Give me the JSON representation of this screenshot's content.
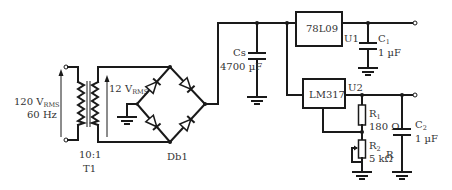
{
  "diagram": {
    "type": "power-supply-schematic",
    "source": {
      "voltage_main": "120 V",
      "voltage_sub": "RMS",
      "frequency": "60 Hz"
    },
    "transformer": {
      "ratio": "10:1",
      "ref": "T1",
      "secondary_voltage_main": "12 V",
      "secondary_voltage_sub": "RMS"
    },
    "bridge": {
      "ref": "Db1"
    },
    "smoothing_cap": {
      "ref": "Cs",
      "value": "4700 µF"
    },
    "regulator1": {
      "part": "78L09",
      "ref": "U1"
    },
    "cap1": {
      "ref_main": "C",
      "ref_sub": "1",
      "value": "1 µF"
    },
    "regulator2": {
      "part": "LM317",
      "ref": "U2"
    },
    "r1": {
      "ref_main": "R",
      "ref_sub": "1",
      "value": "180 Ω"
    },
    "r2": {
      "ref_main": "R",
      "ref_sub": "2",
      "value": "5 kΩ"
    },
    "cap2": {
      "ref_main": "C",
      "ref_sub": "2",
      "value": "1 µF",
      "note": "R"
    }
  }
}
